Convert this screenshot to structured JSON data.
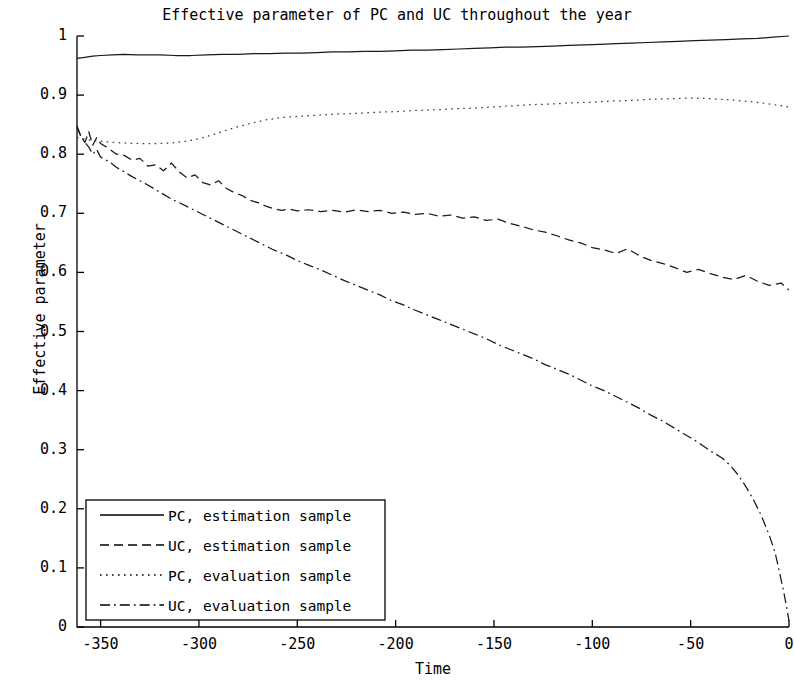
{
  "chart_data": {
    "type": "line",
    "title": "Effective parameter of PC and UC throughout the year",
    "xlabel": "Time",
    "ylabel": "Effective parameter",
    "xlim": [
      -362,
      0
    ],
    "ylim": [
      0,
      1
    ],
    "xticks": [
      -350,
      -300,
      -250,
      -200,
      -150,
      -100,
      -50,
      0
    ],
    "xticklabels": [
      "-350",
      "-300",
      "-250",
      "-200",
      "-150",
      "-100",
      "-50",
      "0"
    ],
    "yticks": [
      0,
      0.1,
      0.2,
      0.3,
      0.4,
      0.5,
      0.6,
      0.7,
      0.8,
      0.9,
      1
    ],
    "yticklabels": [
      "0",
      "0.1",
      "0.2",
      "0.3",
      "0.4",
      "0.5",
      "0.6",
      "0.7",
      "0.8",
      "0.9",
      "1"
    ],
    "grid": false,
    "legend_position": "lower left",
    "series": [
      {
        "name": "PC, estimation sample",
        "style": "solid",
        "color": "#1a1a1a",
        "x": [
          -362,
          -358,
          -354,
          -350,
          -344,
          -338,
          -332,
          -326,
          -320,
          -312,
          -304,
          -296,
          -288,
          -280,
          -272,
          -264,
          -256,
          -248,
          -240,
          -232,
          -224,
          -216,
          -208,
          -200,
          -192,
          -184,
          -176,
          -168,
          -160,
          -152,
          -144,
          -136,
          -128,
          -120,
          -112,
          -104,
          -96,
          -88,
          -80,
          -72,
          -64,
          -56,
          -48,
          -40,
          -32,
          -24,
          -16,
          -8,
          0
        ],
        "y": [
          0.962,
          0.964,
          0.966,
          0.967,
          0.968,
          0.969,
          0.968,
          0.968,
          0.968,
          0.967,
          0.967,
          0.968,
          0.969,
          0.969,
          0.97,
          0.97,
          0.971,
          0.971,
          0.972,
          0.973,
          0.973,
          0.974,
          0.974,
          0.975,
          0.976,
          0.976,
          0.977,
          0.978,
          0.979,
          0.98,
          0.981,
          0.981,
          0.982,
          0.983,
          0.984,
          0.985,
          0.986,
          0.987,
          0.988,
          0.989,
          0.99,
          0.991,
          0.992,
          0.993,
          0.994,
          0.995,
          0.996,
          0.998,
          1.0
        ]
      },
      {
        "name": "UC, estimation sample",
        "style": "dashed",
        "color": "#1a1a1a",
        "x": [
          -362,
          -360,
          -358,
          -356,
          -354,
          -352,
          -350,
          -346,
          -342,
          -338,
          -334,
          -330,
          -326,
          -322,
          -318,
          -314,
          -310,
          -306,
          -302,
          -298,
          -294,
          -290,
          -286,
          -282,
          -278,
          -274,
          -270,
          -266,
          -262,
          -258,
          -254,
          -250,
          -244,
          -238,
          -232,
          -226,
          -220,
          -214,
          -208,
          -202,
          -196,
          -190,
          -184,
          -178,
          -172,
          -166,
          -160,
          -154,
          -148,
          -142,
          -136,
          -130,
          -124,
          -118,
          -112,
          -106,
          -100,
          -94,
          -88,
          -82,
          -76,
          -70,
          -64,
          -58,
          -52,
          -46,
          -40,
          -34,
          -28,
          -22,
          -16,
          -10,
          -4,
          0
        ],
        "y": [
          0.845,
          0.83,
          0.82,
          0.838,
          0.815,
          0.828,
          0.818,
          0.81,
          0.8,
          0.798,
          0.79,
          0.793,
          0.78,
          0.782,
          0.772,
          0.785,
          0.77,
          0.76,
          0.765,
          0.752,
          0.748,
          0.755,
          0.742,
          0.735,
          0.73,
          0.722,
          0.718,
          0.712,
          0.708,
          0.705,
          0.707,
          0.704,
          0.706,
          0.703,
          0.705,
          0.702,
          0.706,
          0.703,
          0.705,
          0.7,
          0.702,
          0.698,
          0.7,
          0.695,
          0.697,
          0.692,
          0.694,
          0.688,
          0.69,
          0.683,
          0.678,
          0.672,
          0.668,
          0.662,
          0.655,
          0.65,
          0.642,
          0.638,
          0.632,
          0.64,
          0.628,
          0.62,
          0.615,
          0.608,
          0.6,
          0.605,
          0.598,
          0.592,
          0.588,
          0.595,
          0.585,
          0.578,
          0.582,
          0.57
        ]
      },
      {
        "name": "PC, evaluation sample",
        "style": "dotted",
        "color": "#3a3a3a",
        "x": [
          -362,
          -356,
          -350,
          -344,
          -338,
          -330,
          -322,
          -314,
          -306,
          -298,
          -290,
          -282,
          -274,
          -266,
          -258,
          -250,
          -240,
          -230,
          -220,
          -210,
          -200,
          -190,
          -180,
          -170,
          -160,
          -150,
          -140,
          -130,
          -120,
          -110,
          -100,
          -90,
          -80,
          -70,
          -60,
          -50,
          -40,
          -30,
          -20,
          -12,
          -6,
          0
        ],
        "y": [
          0.828,
          0.824,
          0.822,
          0.82,
          0.819,
          0.818,
          0.818,
          0.819,
          0.822,
          0.828,
          0.836,
          0.845,
          0.852,
          0.858,
          0.862,
          0.864,
          0.866,
          0.868,
          0.869,
          0.871,
          0.872,
          0.874,
          0.875,
          0.877,
          0.878,
          0.88,
          0.882,
          0.884,
          0.885,
          0.887,
          0.888,
          0.89,
          0.891,
          0.893,
          0.894,
          0.895,
          0.894,
          0.892,
          0.889,
          0.886,
          0.883,
          0.88
        ]
      },
      {
        "name": "UC, evaluation sample",
        "style": "dashdot",
        "color": "#1a1a1a",
        "x": [
          -362,
          -360,
          -358,
          -356,
          -354,
          -352,
          -350,
          -346,
          -342,
          -338,
          -334,
          -330,
          -326,
          -322,
          -318,
          -314,
          -310,
          -304,
          -298,
          -292,
          -286,
          -280,
          -274,
          -268,
          -262,
          -256,
          -250,
          -244,
          -238,
          -232,
          -226,
          -220,
          -214,
          -208,
          -202,
          -196,
          -190,
          -184,
          -178,
          -172,
          -166,
          -160,
          -154,
          -148,
          -142,
          -136,
          -130,
          -124,
          -118,
          -112,
          -106,
          -100,
          -94,
          -88,
          -82,
          -76,
          -70,
          -64,
          -58,
          -52,
          -46,
          -40,
          -34,
          -30,
          -26,
          -22,
          -18,
          -14,
          -10,
          -7,
          -5,
          -3,
          -1,
          0
        ],
        "y": [
          0.848,
          0.83,
          0.82,
          0.812,
          0.8,
          0.808,
          0.795,
          0.788,
          0.778,
          0.77,
          0.762,
          0.755,
          0.748,
          0.74,
          0.732,
          0.724,
          0.718,
          0.708,
          0.698,
          0.688,
          0.678,
          0.668,
          0.658,
          0.648,
          0.638,
          0.63,
          0.62,
          0.612,
          0.604,
          0.595,
          0.586,
          0.578,
          0.57,
          0.562,
          0.552,
          0.545,
          0.536,
          0.528,
          0.52,
          0.512,
          0.504,
          0.496,
          0.488,
          0.478,
          0.47,
          0.462,
          0.454,
          0.444,
          0.436,
          0.428,
          0.418,
          0.408,
          0.4,
          0.39,
          0.38,
          0.37,
          0.358,
          0.348,
          0.336,
          0.324,
          0.312,
          0.298,
          0.286,
          0.274,
          0.258,
          0.238,
          0.215,
          0.188,
          0.155,
          0.125,
          0.095,
          0.065,
          0.03,
          0.01
        ]
      }
    ]
  },
  "axes": {
    "title": "Effective parameter of PC and UC throughout the year",
    "xlabel": "Time",
    "ylabel": "Effective parameter"
  },
  "legend": {
    "entries": [
      {
        "label": "PC, estimation sample",
        "style": "solid"
      },
      {
        "label": "UC, estimation sample",
        "style": "dashed"
      },
      {
        "label": "PC, evaluation sample",
        "style": "dotted"
      },
      {
        "label": "UC, evaluation sample",
        "style": "dashdot"
      }
    ]
  }
}
